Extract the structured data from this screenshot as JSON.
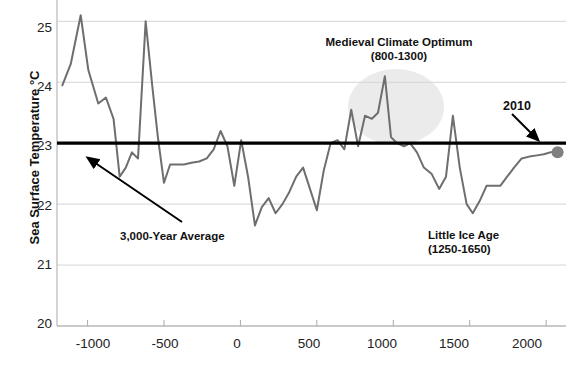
{
  "chart_data": {
    "type": "line",
    "title": "",
    "xlabel": "",
    "ylabel": "Sea Surface Temperature °C",
    "xlim": [
      -1200,
      2130
    ],
    "ylim": [
      20,
      25.35
    ],
    "grid": true,
    "legend": "none",
    "yticks": [
      20,
      21,
      22,
      23,
      24,
      25
    ],
    "ytick_labels": [
      "20",
      "21",
      "22",
      "23",
      "24",
      "25"
    ],
    "xticks": [
      -1000,
      -500,
      0,
      500,
      1000,
      1500,
      2000
    ],
    "xtick_labels": [
      "-1000",
      "-500",
      "0",
      "500",
      "1000",
      "1500",
      "2000"
    ],
    "series": [
      {
        "name": "Sea Surface Temperature",
        "color": "#6e6e6e",
        "x": [
          -1165,
          -1110,
          -1045,
          -995,
          -930,
          -880,
          -830,
          -790,
          -750,
          -710,
          -670,
          -620,
          -575,
          -540,
          -500,
          -460,
          -420,
          -370,
          -320,
          -270,
          -220,
          -175,
          -130,
          -85,
          -40,
          5,
          50,
          95,
          140,
          185,
          230,
          275,
          320,
          365,
          410,
          455,
          500,
          545,
          590,
          635,
          680,
          725,
          770,
          815,
          860,
          900,
          945,
          985,
          1025,
          1070,
          1110,
          1155,
          1200,
          1250,
          1300,
          1345,
          1390,
          1435,
          1480,
          1520,
          1565,
          1610,
          1655,
          1700,
          1745,
          1790,
          1840,
          1890,
          1940,
          1985,
          2030,
          2075
        ],
        "y": [
          23.95,
          24.3,
          25.1,
          24.2,
          23.65,
          23.75,
          23.4,
          22.45,
          22.6,
          22.85,
          22.75,
          25.0,
          23.9,
          23.1,
          22.35,
          22.65,
          22.65,
          22.65,
          22.68,
          22.7,
          22.75,
          22.9,
          23.2,
          22.95,
          22.3,
          23.05,
          22.45,
          21.65,
          21.95,
          22.1,
          21.85,
          22.0,
          22.2,
          22.45,
          22.6,
          22.25,
          21.9,
          22.55,
          23.0,
          23.05,
          22.9,
          23.55,
          22.95,
          23.45,
          23.4,
          23.5,
          24.1,
          23.1,
          23.0,
          22.95,
          23.0,
          22.85,
          22.6,
          22.5,
          22.25,
          22.45,
          23.45,
          22.6,
          22.0,
          21.85,
          22.05,
          22.3,
          22.3,
          22.3,
          22.45,
          22.6,
          22.75,
          22.78,
          22.8,
          22.82,
          22.85,
          22.85
        ]
      }
    ],
    "reference_line": {
      "label": "3,000-Year Average",
      "value": 23.0,
      "color": "#000000"
    },
    "markers": [
      {
        "label": "2010",
        "x": 2075,
        "y": 22.85,
        "color": "#808080"
      }
    ],
    "annotations": [
      {
        "name": "medieval-climate-optimum",
        "line1": "Medieval Climate Optimum",
        "line2": "(800-1300)"
      },
      {
        "name": "little-ice-age",
        "line1": "Little Ice Age",
        "line2": "(1250-1650)"
      },
      {
        "name": "average-line-callout",
        "line1": "3,000-Year Average",
        "line2": ""
      },
      {
        "name": "modern-point-callout",
        "line1": "2010",
        "line2": ""
      }
    ],
    "shaded_regions": [
      {
        "name": "medieval-optimum-highlight",
        "color": "#ebebeb"
      }
    ]
  }
}
